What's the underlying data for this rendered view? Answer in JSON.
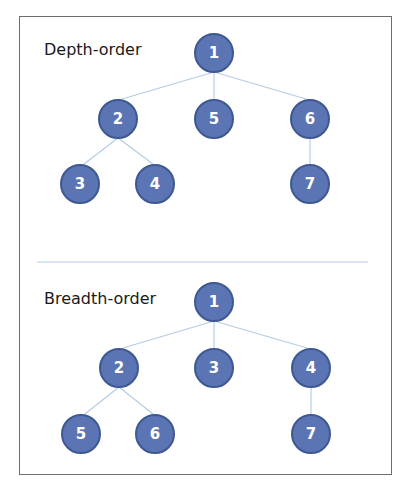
{
  "colors": {
    "node_fill": "#5b74b3",
    "node_stroke": "#3e5891",
    "edge": "#b4cce6",
    "frame_border": "#6e6e6e"
  },
  "depth_tree": {
    "title": "Depth-order",
    "nodes": [
      {
        "id": "root",
        "label": "1",
        "x": 214,
        "y": 53
      },
      {
        "id": "l1a",
        "label": "2",
        "x": 118,
        "y": 119
      },
      {
        "id": "l1b",
        "label": "5",
        "x": 214,
        "y": 119
      },
      {
        "id": "l1c",
        "label": "6",
        "x": 310,
        "y": 119
      },
      {
        "id": "l2a",
        "label": "3",
        "x": 80,
        "y": 184
      },
      {
        "id": "l2b",
        "label": "4",
        "x": 155,
        "y": 184
      },
      {
        "id": "l2c",
        "label": "7",
        "x": 310,
        "y": 184
      }
    ]
  },
  "breadth_tree": {
    "title": "Breadth-order",
    "nodes": [
      {
        "id": "root",
        "label": "1",
        "x": 214,
        "y": 302
      },
      {
        "id": "l1a",
        "label": "2",
        "x": 119,
        "y": 368
      },
      {
        "id": "l1b",
        "label": "3",
        "x": 214,
        "y": 368
      },
      {
        "id": "l1c",
        "label": "4",
        "x": 311,
        "y": 368
      },
      {
        "id": "l2a",
        "label": "5",
        "x": 81,
        "y": 434
      },
      {
        "id": "l2b",
        "label": "6",
        "x": 155,
        "y": 434
      },
      {
        "id": "l2c",
        "label": "7",
        "x": 311,
        "y": 434
      }
    ]
  }
}
